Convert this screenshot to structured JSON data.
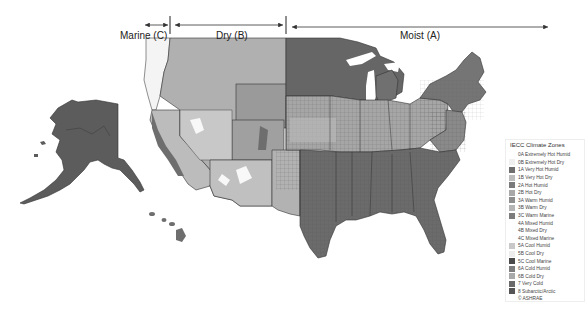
{
  "title_regions": [
    {
      "id": "marine",
      "label": "Marine (C)"
    },
    {
      "id": "dry",
      "label": "Dry (B)"
    },
    {
      "id": "moist",
      "label": "Moist (A)"
    }
  ],
  "legend": {
    "title": "IECC Climate Zones",
    "items": [
      {
        "code": "0A",
        "label": "0A Extremely Hot Humid",
        "color": "#ffffff"
      },
      {
        "code": "0B",
        "label": "0B Extremely Hot Dry",
        "color": "#f2f2f2"
      },
      {
        "code": "1A",
        "label": "1A Very Hot Humid",
        "color": "#6e6e6e"
      },
      {
        "code": "1B",
        "label": "1B Very Hot Dry",
        "color": "#bdbdbd"
      },
      {
        "code": "2A",
        "label": "2A Hot Humid",
        "color": "#7a7a7a"
      },
      {
        "code": "2B",
        "label": "2B Hot Dry",
        "color": "#a8a8a8"
      },
      {
        "code": "3A",
        "label": "3A Warm Humid",
        "color": "#8e8e8e"
      },
      {
        "code": "3B",
        "label": "3B Warm Dry",
        "color": "#b5b5b5"
      },
      {
        "code": "3C",
        "label": "3C Warm Marine",
        "color": "#7c7c7c"
      },
      {
        "code": "4A",
        "label": "4A Mixed Humid",
        "color": "#ffffff"
      },
      {
        "code": "4B",
        "label": "4B Mixed Dry",
        "color": "#ffffff"
      },
      {
        "code": "4C",
        "label": "4C Mixed Marine",
        "color": "#ffffff"
      },
      {
        "code": "5A",
        "label": "5A Cool Humid",
        "color": "#c8c8c8"
      },
      {
        "code": "5B",
        "label": "5B Cool Dry",
        "color": "#ededed"
      },
      {
        "code": "5C",
        "label": "5C Cool Marine",
        "color": "#4a4a4a"
      },
      {
        "code": "6A",
        "label": "6A Cold Humid",
        "color": "#7e7e7e"
      },
      {
        "code": "6B",
        "label": "6B Cold Dry",
        "color": "#a9a9a9"
      },
      {
        "code": "7",
        "label": "7 Very Cold",
        "color": "#6a6a6a"
      },
      {
        "code": "8",
        "label": "8 Subarctic/Arctic",
        "color": "#555555"
      }
    ],
    "credit": "© ASHRAE"
  },
  "map_regions": {
    "alaska": {
      "zone": "7/8",
      "fill": "#5c5c5c"
    },
    "hawaii": {
      "zone": "1A",
      "fill": "#6e6e6e"
    },
    "pacific_coast": {
      "zone": "4C/3C",
      "fill": "#f4f4f4"
    },
    "mountain_west": {
      "zone": "5B/6B",
      "fill": "#b0b0b0"
    },
    "southwest": {
      "zone": "2B/3B",
      "fill": "#c4c4c4"
    },
    "upper_midwest": {
      "zone": "6A/7",
      "fill": "#666666"
    },
    "central_plains": {
      "zone": "4A/5A",
      "fill": "#a6a6a6"
    },
    "southeast": {
      "zone": "2A/3A",
      "fill": "#6b6b6b"
    },
    "northeast": {
      "zone": "5A/6A",
      "fill": "#757575"
    }
  }
}
